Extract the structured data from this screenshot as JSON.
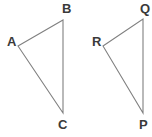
{
  "figure": {
    "type": "geometry-diagram",
    "canvas": {
      "width": 152,
      "height": 137,
      "background": "#ffffff"
    },
    "style": {
      "stroke_color": "#808080",
      "stroke_width": 1.1,
      "label_color": "#3a3a3a",
      "label_font_size": 13,
      "label_font_weight": "bold"
    },
    "shapes": [
      {
        "name": "triangle-abc",
        "vertices": [
          {
            "label": "A",
            "x": 18,
            "y": 46,
            "label_x": 7,
            "label_y": 35
          },
          {
            "label": "B",
            "x": 63,
            "y": 20,
            "label_x": 62,
            "label_y": 2
          },
          {
            "label": "C",
            "x": 63,
            "y": 113,
            "label_x": 58,
            "label_y": 118
          }
        ],
        "edges": [
          "A-B",
          "B-C",
          "C-A"
        ]
      },
      {
        "name": "triangle-rqp",
        "vertices": [
          {
            "label": "R",
            "x": 103,
            "y": 46,
            "label_x": 92,
            "label_y": 35
          },
          {
            "label": "Q",
            "x": 143,
            "y": 19,
            "label_x": 140,
            "label_y": 2
          },
          {
            "label": "P",
            "x": 143,
            "y": 113,
            "label_x": 139,
            "label_y": 118
          }
        ],
        "edges": [
          "R-Q",
          "Q-P",
          "P-R"
        ]
      }
    ]
  }
}
